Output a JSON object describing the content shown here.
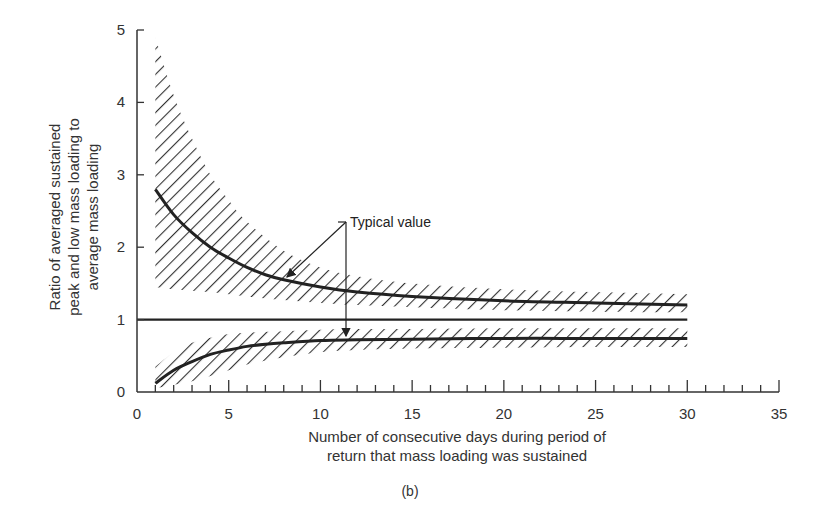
{
  "chart_data": {
    "type": "line",
    "title": "",
    "caption": "(b)",
    "xlabel_lines": [
      "Number of consecutive days during period of",
      "return that mass loading was sustained"
    ],
    "ylabel_lines": [
      "Ratio of averaged sustained",
      "peak and low mass loading to",
      "average mass loading"
    ],
    "xlim": [
      0,
      35
    ],
    "ylim": [
      0,
      5
    ],
    "x_ticks": [
      0,
      5,
      10,
      15,
      20,
      25,
      30,
      35
    ],
    "x_minor_step": 1,
    "y_ticks": [
      0,
      1,
      2,
      3,
      4,
      5
    ],
    "grid": false,
    "annotation": "Typical value",
    "series": [
      {
        "name": "Typical peak ratio",
        "x": [
          1,
          2,
          3,
          4,
          5,
          6,
          7,
          8,
          10,
          12,
          15,
          20,
          25,
          30
        ],
        "values": [
          2.8,
          2.45,
          2.2,
          2.0,
          1.85,
          1.72,
          1.62,
          1.55,
          1.45,
          1.38,
          1.32,
          1.26,
          1.23,
          1.2
        ]
      },
      {
        "name": "Average (ratio = 1)",
        "x": [
          0,
          30
        ],
        "values": [
          1.0,
          1.0
        ]
      },
      {
        "name": "Typical low ratio",
        "x": [
          1,
          2,
          3,
          4,
          5,
          6,
          7,
          8,
          10,
          12,
          15,
          20,
          25,
          30
        ],
        "values": [
          0.12,
          0.3,
          0.42,
          0.52,
          0.58,
          0.63,
          0.66,
          0.68,
          0.71,
          0.72,
          0.73,
          0.74,
          0.74,
          0.74
        ]
      }
    ],
    "bands": [
      {
        "name": "Peak range (hatched)",
        "x": [
          1,
          2,
          3,
          4,
          5,
          6,
          8,
          10,
          12,
          15,
          20,
          25,
          30
        ],
        "upper": [
          4.9,
          4.1,
          3.5,
          3.0,
          2.65,
          2.35,
          1.95,
          1.72,
          1.6,
          1.5,
          1.42,
          1.38,
          1.35
        ],
        "lower": [
          1.45,
          1.42,
          1.4,
          1.38,
          1.35,
          1.32,
          1.27,
          1.23,
          1.2,
          1.17,
          1.13,
          1.11,
          1.1
        ]
      },
      {
        "name": "Low range (hatched)",
        "x": [
          1,
          2,
          3,
          4,
          5,
          6,
          8,
          10,
          12,
          15,
          20,
          25,
          30
        ],
        "upper": [
          0.35,
          0.55,
          0.68,
          0.75,
          0.8,
          0.82,
          0.84,
          0.86,
          0.87,
          0.87,
          0.88,
          0.88,
          0.88
        ],
        "lower": [
          0.05,
          0.1,
          0.15,
          0.22,
          0.3,
          0.38,
          0.48,
          0.55,
          0.58,
          0.6,
          0.61,
          0.62,
          0.62
        ]
      }
    ]
  }
}
